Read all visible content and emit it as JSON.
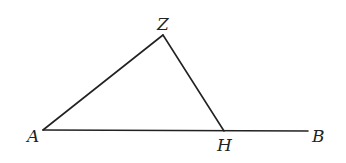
{
  "diagram": {
    "type": "geometric-figure",
    "points": {
      "A": {
        "label": "A",
        "x": 43,
        "y": 130,
        "label_x": 27,
        "label_y": 142
      },
      "Z": {
        "label": "Z",
        "x": 163,
        "y": 35,
        "label_x": 157,
        "label_y": 30
      },
      "H": {
        "label": "H",
        "x": 224,
        "y": 131,
        "label_x": 217,
        "label_y": 151
      },
      "B": {
        "label": "B",
        "x": 308,
        "y": 131,
        "label_x": 312,
        "label_y": 142
      }
    },
    "segments": [
      {
        "from": "A",
        "to": "B"
      },
      {
        "from": "A",
        "to": "Z"
      },
      {
        "from": "Z",
        "to": "H"
      }
    ],
    "stroke_color": "#222222",
    "background": "#ffffff"
  }
}
